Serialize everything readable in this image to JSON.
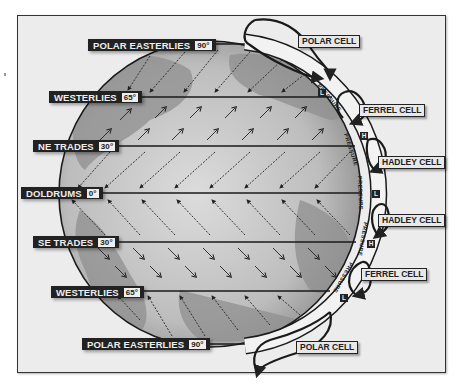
{
  "diagram": {
    "wind_belts": [
      {
        "name": "POLAR EASTERLIES",
        "latitude": "90°",
        "hemisphere": "north"
      },
      {
        "name": "WESTERLIES",
        "latitude": "65°",
        "hemisphere": "north"
      },
      {
        "name": "NE TRADES",
        "latitude": "30°",
        "hemisphere": "north"
      },
      {
        "name": "DOLDRUMS",
        "latitude": "0°",
        "hemisphere": "equator"
      },
      {
        "name": "SE TRADES",
        "latitude": "30°",
        "hemisphere": "south"
      },
      {
        "name": "WESTERLIES",
        "latitude": "65°",
        "hemisphere": "south"
      },
      {
        "name": "POLAR EASTERLIES",
        "latitude": "90°",
        "hemisphere": "south"
      }
    ],
    "cells": [
      {
        "name": "POLAR CELL"
      },
      {
        "name": "FERREL CELL"
      },
      {
        "name": "HADLEY CELL"
      },
      {
        "name": "HADLEY CELL"
      },
      {
        "name": "FERREL CELL"
      },
      {
        "name": "POLAR CELL"
      }
    ],
    "pressure_label": "PRESSURE",
    "pressure_zones": [
      {
        "letter": "L",
        "latitude": "65°N"
      },
      {
        "letter": "H",
        "latitude": "30°N"
      },
      {
        "letter": "L",
        "latitude": "0°"
      },
      {
        "letter": "H",
        "latitude": "30°S"
      },
      {
        "letter": "L",
        "latitude": "65°S"
      }
    ],
    "arrow_directions": {
      "polar_easterlies_north": "southwest",
      "westerlies_north": "northeast",
      "ne_trades": "southwest",
      "se_trades": "northwest",
      "westerlies_south": "southeast",
      "polar_easterlies_south": "northwest"
    },
    "colors": {
      "background": "#ececec",
      "globe_land": "#8a8a8a",
      "globe_ocean": "#c8c8c8",
      "label_bg": "#222222",
      "label_text": "#eeeeee"
    }
  }
}
